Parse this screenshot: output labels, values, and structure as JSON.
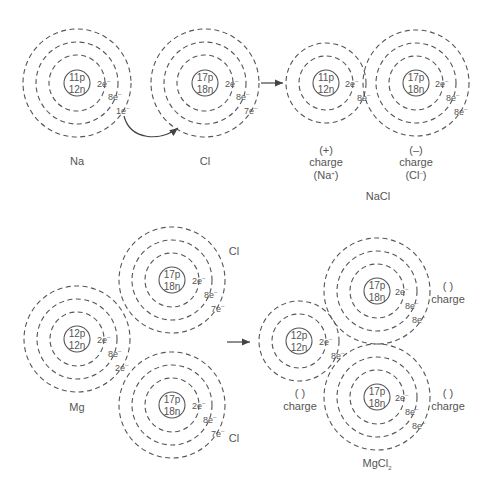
{
  "colors": {
    "line": "#555555",
    "background": "#ffffff"
  },
  "top_row": {
    "na_atom": {
      "label": "Na",
      "protons": "11p",
      "neutrons": "12n",
      "shells": [
        "2e",
        "8e",
        "1e"
      ]
    },
    "cl_atom": {
      "label": "Cl",
      "protons": "17p",
      "neutrons": "18n",
      "shells": [
        "2e",
        "8e",
        "7e"
      ]
    },
    "na_ion": {
      "charge_sign": "(+)",
      "charge_word": "charge",
      "ion_label": "(Na",
      "ion_sup": "+",
      "ion_close": ")",
      "protons": "11p",
      "neutrons": "12n",
      "shells": [
        "2e",
        "8e"
      ]
    },
    "cl_ion": {
      "charge_sign": "(–)",
      "charge_word": "charge",
      "ion_label": "(Cl",
      "ion_sup": "–",
      "ion_close": ")",
      "protons": "17p",
      "neutrons": "18n",
      "shells": [
        "2e",
        "8e",
        "8e"
      ]
    },
    "product_label": "NaCl"
  },
  "bottom_row": {
    "mg_atom": {
      "label": "Mg",
      "protons": "12p",
      "neutrons": "12n",
      "shells": [
        "2e",
        "8e",
        "2e"
      ]
    },
    "cl_atom_top": {
      "label": "Cl",
      "protons": "17p",
      "neutrons": "18n",
      "shells": [
        "2e",
        "8e",
        "7e"
      ]
    },
    "cl_atom_bottom": {
      "label": "Cl",
      "protons": "17p",
      "neutrons": "18n",
      "shells": [
        "2e",
        "8e",
        "7e"
      ]
    },
    "mg_ion": {
      "charge_blank": "(  )",
      "charge_word": "charge",
      "protons": "12p",
      "neutrons": "12n",
      "shells": [
        "2e",
        "8e"
      ]
    },
    "cl_ion_top": {
      "charge_blank": "(  )",
      "charge_word": "charge",
      "protons": "17p",
      "neutrons": "18n",
      "shells": [
        "2e",
        "8e",
        "8e"
      ]
    },
    "cl_ion_bottom": {
      "charge_blank": "(  )",
      "charge_word": "charge",
      "protons": "17p",
      "neutrons": "18n",
      "shells": [
        "2e",
        "8e",
        "8e"
      ]
    },
    "product_label": "MgCl",
    "product_subscript": "2"
  },
  "electron_superscript": "–"
}
